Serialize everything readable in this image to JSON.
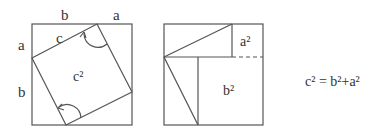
{
  "figure": {
    "left_panel": {
      "labels": {
        "top_b": "b",
        "top_a": "a",
        "side_a": "a",
        "side_b": "b",
        "hyp_c": "c",
        "center_c2": "c²"
      }
    },
    "right_panel": {
      "labels": {
        "a2": "a²",
        "b2": "b²"
      }
    },
    "equation": "c² = b²+a²"
  },
  "colors": {
    "line": "#555555",
    "text": "#333333",
    "background": "#ffffff"
  }
}
